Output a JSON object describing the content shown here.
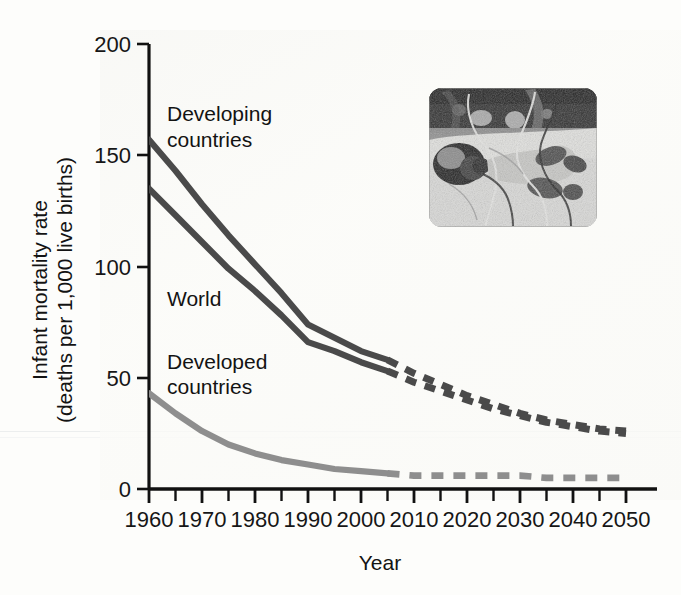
{
  "chart_data": {
    "type": "line",
    "title": "",
    "xlabel": "Year",
    "ylabel": "Infant mortality rate\n(deaths per 1,000 live births)",
    "ylabel_line1": "Infant mortality rate",
    "ylabel_line2": "(deaths per 1,000 live births)",
    "xlim": [
      1960,
      2055
    ],
    "ylim": [
      0,
      200
    ],
    "grid": false,
    "legend_position": "inline-labels",
    "x_ticks": [
      1960,
      1970,
      1980,
      1990,
      2000,
      2010,
      2020,
      2030,
      2040,
      2050
    ],
    "x_tick_labels": [
      "1960",
      "1970",
      "1980",
      "1990",
      "2000",
      "2010",
      "2020",
      "2030",
      "2040",
      "2050"
    ],
    "x_minor_ticks": [
      1965,
      1975,
      1985,
      1995,
      2005,
      2015,
      2025,
      2035,
      2045
    ],
    "y_ticks": [
      0,
      50,
      100,
      150,
      200
    ],
    "y_tick_labels": [
      "0",
      "50",
      "100",
      "150",
      "200"
    ],
    "projection_start_year": 2005,
    "series": [
      {
        "name": "Developing countries",
        "color": "#4a4a4a",
        "label_line1": "Developing",
        "label_line2": "countries",
        "observed_x": [
          1960,
          1965,
          1970,
          1975,
          1980,
          1985,
          1990,
          1995,
          2000,
          2005
        ],
        "observed_values": [
          157,
          143,
          128,
          114,
          101,
          88,
          74,
          68,
          62,
          58
        ],
        "projected_x": [
          2005,
          2010,
          2015,
          2020,
          2025,
          2030,
          2035,
          2040,
          2045,
          2050
        ],
        "projected_values": [
          58,
          52,
          47,
          42,
          38,
          34,
          31,
          29,
          27,
          26
        ]
      },
      {
        "name": "World",
        "color": "#4a4a4a",
        "label_line1": "World",
        "label_line2": "",
        "observed_x": [
          1960,
          1965,
          1970,
          1975,
          1980,
          1985,
          1990,
          1995,
          2000,
          2005
        ],
        "observed_values": [
          135,
          123,
          111,
          99,
          89,
          78,
          66,
          62,
          57,
          53
        ],
        "projected_x": [
          2005,
          2010,
          2015,
          2020,
          2025,
          2030,
          2035,
          2040,
          2045,
          2050
        ],
        "projected_values": [
          53,
          48,
          44,
          40,
          36,
          33,
          30,
          28,
          26,
          25
        ]
      },
      {
        "name": "Developed countries",
        "color": "#8e8e8e",
        "label_line1": "Developed",
        "label_line2": "countries",
        "observed_x": [
          1960,
          1965,
          1970,
          1975,
          1980,
          1985,
          1990,
          1995,
          2000,
          2005
        ],
        "observed_values": [
          43,
          34,
          26,
          20,
          16,
          13,
          11,
          9,
          8,
          7
        ],
        "projected_x": [
          2005,
          2010,
          2015,
          2020,
          2025,
          2030,
          2035,
          2040,
          2045,
          2050
        ],
        "projected_values": [
          7,
          6,
          6,
          6,
          6,
          6,
          5,
          5,
          5,
          5
        ]
      }
    ],
    "annotations": [
      {
        "name": "developing-countries-label",
        "text_line1": "Developing",
        "text_line2": "countries"
      },
      {
        "name": "world-label",
        "text_line1": "World",
        "text_line2": ""
      },
      {
        "name": "developed-countries-label",
        "text_line1": "Developed",
        "text_line2": "countries"
      }
    ],
    "inset": {
      "name": "premature-infant-photo",
      "description": "Grayscale photograph of a premature infant in an incubator with monitoring wires and tubing",
      "alt": "premature infant with medical monitoring wires"
    },
    "colors": {
      "series_dark": "#4a4a4a",
      "series_light": "#8e8e8e",
      "axis": "#111111",
      "background": "#fdfdfb",
      "text": "#131313"
    }
  }
}
